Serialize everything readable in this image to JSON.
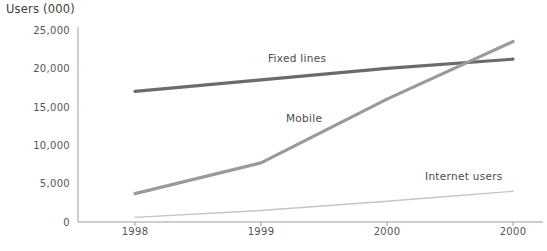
{
  "chart_data": {
    "type": "line",
    "title": "",
    "ylabel": "Users (000)",
    "xlabel": "",
    "categories": [
      "1998",
      "1999",
      "2000",
      "2000"
    ],
    "x": [
      1998,
      1999,
      2000,
      2001
    ],
    "ylim": [
      0,
      25000
    ],
    "xlim": [
      1998,
      2001
    ],
    "yticks": [
      "0",
      "5,000",
      "10,000",
      "15,000",
      "20,000",
      "25,000"
    ],
    "ytick_values": [
      0,
      5000,
      10000,
      15000,
      20000,
      25000
    ],
    "grid": false,
    "legend_position": "inline-labels",
    "series": [
      {
        "name": "Fixed lines",
        "color": "#6b6b6b",
        "width": 3.2,
        "values": [
          17000,
          18500,
          20000,
          21200
        ]
      },
      {
        "name": "Mobile",
        "color": "#9a9a9a",
        "width": 3.2,
        "values": [
          3700,
          7700,
          16000,
          23500
        ]
      },
      {
        "name": "Internet users",
        "color": "#c4c4c4",
        "width": 1.4,
        "values": [
          600,
          1500,
          2700,
          4000
        ]
      }
    ],
    "annotations": [
      {
        "text": "Fixed lines",
        "x": 268,
        "y": 52
      },
      {
        "text": "Mobile",
        "x": 286,
        "y": 112
      },
      {
        "text": "Internet users",
        "x": 425,
        "y": 170
      }
    ],
    "axis_color": "#9d9d9d"
  },
  "caption": ""
}
